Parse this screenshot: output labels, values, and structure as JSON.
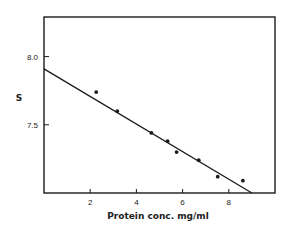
{
  "chart_data": {
    "type": "scatter",
    "title": "",
    "xlabel": "Protein conc.  mg/ml",
    "ylabel": "S",
    "xlim": [
      0,
      10
    ],
    "ylim": [
      7.0,
      8.29
    ],
    "grid": false,
    "legend": null,
    "x_ticks": [
      2,
      4,
      6,
      8
    ],
    "x_tick_labels": [
      "2",
      "4",
      "6",
      "8"
    ],
    "y_ticks": [
      7.5,
      8.0
    ],
    "y_tick_labels": [
      "7.5",
      "8.0"
    ],
    "series": [
      {
        "name": "measured",
        "kind": "points",
        "x": [
          2.26,
          3.17,
          4.65,
          5.35,
          5.74,
          6.7,
          7.52,
          8.61
        ],
        "y": [
          7.74,
          7.6,
          7.44,
          7.38,
          7.3,
          7.24,
          7.12,
          7.09
        ]
      },
      {
        "name": "fit",
        "kind": "line",
        "x": [
          0,
          9.0
        ],
        "y": [
          7.91,
          7.0
        ]
      }
    ],
    "colors": {
      "ink": "#1a1a1a",
      "background": "#ffffff"
    }
  }
}
